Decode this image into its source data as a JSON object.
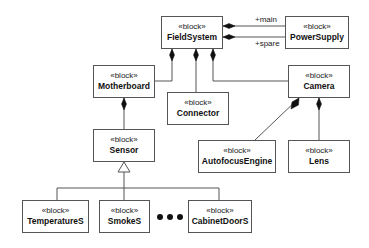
{
  "stereotype": "«block»",
  "blocks": [
    {
      "id": "fieldsystem",
      "name": "FieldSystem",
      "x": 161,
      "y": 16,
      "w": 62,
      "h": 33
    },
    {
      "id": "powersupply",
      "name": "PowerSupply",
      "x": 285,
      "y": 16,
      "w": 64,
      "h": 33
    },
    {
      "id": "motherboard",
      "name": "Motherboard",
      "x": 93,
      "y": 65,
      "w": 62,
      "h": 33
    },
    {
      "id": "connector",
      "name": "Connector",
      "x": 167,
      "y": 92,
      "w": 62,
      "h": 33
    },
    {
      "id": "camera",
      "name": "Camera",
      "x": 288,
      "y": 65,
      "w": 62,
      "h": 33
    },
    {
      "id": "sensor",
      "name": "Sensor",
      "x": 93,
      "y": 129,
      "w": 62,
      "h": 33
    },
    {
      "id": "autofocusengine",
      "name": "AutofocusEngine",
      "x": 198,
      "y": 140,
      "w": 78,
      "h": 33
    },
    {
      "id": "lens",
      "name": "Lens",
      "x": 288,
      "y": 140,
      "w": 62,
      "h": 33
    },
    {
      "id": "temperatures",
      "name": "TemperatureS",
      "x": 22,
      "y": 200,
      "w": 67,
      "h": 33
    },
    {
      "id": "smokes",
      "name": "SmokeS",
      "x": 99,
      "y": 200,
      "w": 51,
      "h": 33
    },
    {
      "id": "cabinetdoors",
      "name": "CabinetDoorS",
      "x": 188,
      "y": 200,
      "w": 64,
      "h": 33
    }
  ],
  "roles": {
    "main": "+main",
    "spare": "+spare"
  },
  "ellipsis": "•••",
  "colors": {
    "line": "#555555",
    "text": "#111111",
    "background": "#ffffff"
  }
}
